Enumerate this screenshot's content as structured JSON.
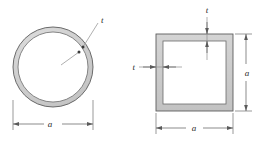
{
  "figure": {
    "background_color": "#ffffff",
    "outline_color": "#4a4a4a",
    "wall_fill_color": "#c9c9c9",
    "interior_fill_color": "#ffffff",
    "dimension_line_color": "#5a5a5a",
    "leader_line_color": "#8a8a8a",
    "label_color": "#2b2b2b"
  },
  "circle_section": {
    "name": "hollow-circular-tube",
    "thickness_label": "t",
    "diameter_label": "a",
    "outer_diameter_px": 80,
    "wall_thickness_px": 5,
    "center": {
      "x": 53,
      "y": 67
    }
  },
  "square_section": {
    "name": "hollow-square-tube",
    "thickness_label_top": "t",
    "thickness_label_left": "t",
    "width_label": "a",
    "height_label": "a",
    "outer_side_px": 77,
    "wall_thickness_px": 7,
    "origin": {
      "x": 156,
      "y": 34
    }
  }
}
